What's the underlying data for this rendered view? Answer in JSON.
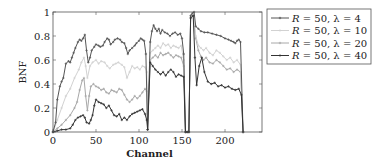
{
  "chart_data": {
    "type": "line",
    "title": "",
    "xlabel": "Channel",
    "ylabel": "BNF",
    "xlim": [
      0,
      243
    ],
    "ylim": [
      0,
      1
    ],
    "xticks": [
      0,
      50,
      100,
      150,
      200
    ],
    "xtick_labels": [
      "0",
      "50",
      "100",
      "150",
      "200"
    ],
    "yticks": [
      0,
      0.2,
      0.4,
      0.6,
      0.8,
      1
    ],
    "ytick_labels": [
      "0",
      "0.2",
      "0.4",
      "0.6",
      "0.8",
      "1"
    ],
    "grid": false,
    "legend_position": "outside-top-right",
    "series": [
      {
        "name": "R = 50, λ = 4",
        "legend_parts": {
          "R": "R",
          "eq1": " = 50, ",
          "lam": "λ",
          "eq2": " = 4"
        },
        "color": "#555555",
        "marker": "x",
        "x": [
          0,
          3,
          5,
          8,
          10,
          12,
          15,
          18,
          20,
          22,
          24,
          26,
          29,
          31,
          33,
          35,
          37,
          39,
          41,
          43,
          45,
          48,
          50,
          53,
          55,
          58,
          60,
          63,
          65,
          67,
          70,
          72,
          75,
          78,
          80,
          83,
          85,
          87,
          89,
          92,
          95,
          97,
          100,
          102,
          104,
          106,
          108,
          110,
          113,
          115,
          117,
          119,
          121,
          123,
          125,
          127,
          130,
          133,
          136,
          139,
          142,
          145,
          148,
          150,
          152,
          154,
          156,
          158,
          160,
          162,
          164,
          166,
          169,
          172,
          176,
          180,
          185,
          190,
          195,
          200,
          204,
          207,
          210,
          212,
          214,
          216,
          218,
          221
        ],
        "y": [
          0,
          0.08,
          0.27,
          0.38,
          0.42,
          0.45,
          0.57,
          0.59,
          0.58,
          0.62,
          0.66,
          0.7,
          0.75,
          0.77,
          0.76,
          0.78,
          0.81,
          0.68,
          0.58,
          0.62,
          0.68,
          0.71,
          0.73,
          0.72,
          0.71,
          0.72,
          0.75,
          0.78,
          0.77,
          0.73,
          0.75,
          0.77,
          0.78,
          0.77,
          0.75,
          0.74,
          0.7,
          0.65,
          0.68,
          0.7,
          0.72,
          0.74,
          0.76,
          0.78,
          0.77,
          0.76,
          0.65,
          0.02,
          0.75,
          0.84,
          0.89,
          0.86,
          0.84,
          0.86,
          0.82,
          0.85,
          0.83,
          0.82,
          0.8,
          0.82,
          0.83,
          0.81,
          0.82,
          0.78,
          0.65,
          0.0,
          0.0,
          0.0,
          0.97,
          0.99,
          1.0,
          0.88,
          0.86,
          0.84,
          0.83,
          0.83,
          0.82,
          0.81,
          0.8,
          0.78,
          0.77,
          0.76,
          0.75,
          0.74,
          0.76,
          0.77,
          0.75,
          0.0
        ]
      },
      {
        "name": "R = 50, λ = 10",
        "legend_parts": {
          "R": "R",
          "eq1": " = 50, ",
          "lam": "λ",
          "eq2": " = 10"
        },
        "color": "#d2d2d2",
        "marker": "x",
        "x": [
          0,
          5,
          10,
          15,
          20,
          25,
          30,
          33,
          36,
          38,
          40,
          43,
          46,
          50,
          53,
          56,
          60,
          63,
          66,
          70,
          73,
          76,
          80,
          83,
          86,
          89,
          92,
          95,
          98,
          101,
          104,
          107,
          109,
          110,
          113,
          116,
          119,
          122,
          125,
          128,
          131,
          134,
          137,
          140,
          143,
          146,
          149,
          152,
          154,
          156,
          158,
          160,
          163,
          166,
          169,
          172,
          175,
          178,
          182,
          186,
          190,
          194,
          198,
          202,
          206,
          210,
          214,
          218,
          221
        ],
        "y": [
          0,
          0.1,
          0.2,
          0.3,
          0.36,
          0.45,
          0.52,
          0.58,
          0.62,
          0.55,
          0.45,
          0.55,
          0.58,
          0.6,
          0.57,
          0.59,
          0.58,
          0.55,
          0.53,
          0.56,
          0.57,
          0.58,
          0.56,
          0.54,
          0.45,
          0.5,
          0.55,
          0.53,
          0.54,
          0.52,
          0.55,
          0.54,
          0.5,
          0.02,
          0.66,
          0.68,
          0.7,
          0.72,
          0.7,
          0.74,
          0.72,
          0.73,
          0.7,
          0.72,
          0.71,
          0.7,
          0.72,
          0.6,
          0.0,
          0.0,
          0.0,
          0.96,
          0.98,
          0.8,
          0.72,
          0.7,
          0.68,
          0.7,
          0.66,
          0.64,
          0.68,
          0.66,
          0.63,
          0.6,
          0.62,
          0.58,
          0.6,
          0.56,
          0.0
        ]
      },
      {
        "name": "R = 50, λ = 20",
        "legend_parts": {
          "R": "R",
          "eq1": " = 50, ",
          "lam": "λ",
          "eq2": " = 20"
        },
        "color": "#a8a8a8",
        "marker": "x",
        "x": [
          0,
          5,
          10,
          15,
          20,
          25,
          28,
          31,
          34,
          36,
          38,
          40,
          42,
          44,
          47,
          50,
          53,
          56,
          59,
          62,
          65,
          68,
          71,
          74,
          77,
          80,
          83,
          86,
          89,
          92,
          95,
          98,
          101,
          104,
          107,
          109,
          110,
          113,
          116,
          119,
          122,
          125,
          128,
          131,
          134,
          137,
          140,
          143,
          146,
          149,
          152,
          154,
          156,
          158,
          160,
          163,
          166,
          169,
          172,
          175,
          178,
          182,
          186,
          190,
          194,
          198,
          202,
          206,
          210,
          214,
          218,
          221
        ],
        "y": [
          0,
          0.03,
          0.06,
          0.1,
          0.14,
          0.2,
          0.25,
          0.35,
          0.43,
          0.45,
          0.3,
          0.18,
          0.3,
          0.38,
          0.4,
          0.38,
          0.37,
          0.35,
          0.36,
          0.33,
          0.32,
          0.35,
          0.34,
          0.33,
          0.36,
          0.35,
          0.31,
          0.27,
          0.25,
          0.27,
          0.3,
          0.28,
          0.3,
          0.33,
          0.36,
          0.34,
          0.02,
          0.6,
          0.62,
          0.64,
          0.62,
          0.66,
          0.64,
          0.65,
          0.66,
          0.64,
          0.62,
          0.64,
          0.63,
          0.62,
          0.55,
          0.0,
          0.0,
          0.0,
          0.95,
          0.97,
          0.78,
          0.68,
          0.63,
          0.6,
          0.62,
          0.58,
          0.57,
          0.6,
          0.58,
          0.55,
          0.52,
          0.53,
          0.5,
          0.52,
          0.5,
          0.0
        ]
      },
      {
        "name": "R = 50, λ = 40",
        "legend_parts": {
          "R": "R",
          "eq1": " = 50, ",
          "lam": "λ",
          "eq2": " = 40"
        },
        "color": "#333333",
        "marker": "x",
        "x": [
          0,
          5,
          10,
          15,
          20,
          23,
          26,
          29,
          32,
          35,
          37,
          39,
          42,
          44,
          46,
          48,
          50,
          53,
          56,
          59,
          62,
          65,
          68,
          71,
          74,
          77,
          80,
          83,
          86,
          89,
          92,
          95,
          98,
          101,
          104,
          107,
          109,
          110,
          113,
          116,
          119,
          122,
          125,
          128,
          131,
          134,
          137,
          140,
          143,
          146,
          149,
          152,
          154,
          156,
          158,
          160,
          163,
          165,
          167,
          170,
          173,
          176,
          180,
          184,
          188,
          192,
          196,
          200,
          204,
          208,
          212,
          216,
          219,
          221
        ],
        "y": [
          0,
          0.01,
          0.02,
          0.02,
          0.03,
          0.06,
          0.1,
          0.12,
          0.13,
          0.14,
          0.12,
          0.08,
          0.07,
          0.1,
          0.14,
          0.22,
          0.27,
          0.25,
          0.24,
          0.23,
          0.2,
          0.22,
          0.18,
          0.14,
          0.13,
          0.15,
          0.1,
          0.12,
          0.1,
          0.13,
          0.15,
          0.16,
          0.17,
          0.18,
          0.19,
          0.15,
          0.1,
          0.02,
          0.58,
          0.55,
          0.52,
          0.5,
          0.48,
          0.5,
          0.47,
          0.5,
          0.52,
          0.5,
          0.46,
          0.48,
          0.47,
          0.46,
          0.0,
          0.0,
          0.0,
          0.95,
          0.97,
          0.62,
          0.39,
          0.55,
          0.62,
          0.5,
          0.42,
          0.4,
          0.41,
          0.38,
          0.39,
          0.37,
          0.38,
          0.36,
          0.35,
          0.36,
          0.31,
          0.0
        ]
      }
    ]
  }
}
